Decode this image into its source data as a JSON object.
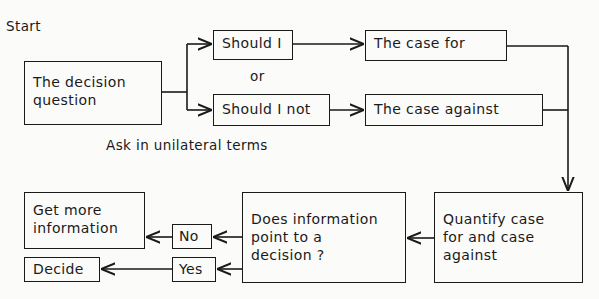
{
  "diagram": {
    "start_label": "Start",
    "or_label": "or",
    "note": "Ask in unilateral terms",
    "nodes": {
      "question": [
        "The decision",
        "question"
      ],
      "should": "Should I",
      "should_not": "Should I not",
      "case_for": "The case for",
      "case_against": "The case against",
      "quantify": [
        "Quantify case",
        "for and case",
        "against"
      ],
      "does_info": [
        "Does information",
        "point to a",
        "decision ?"
      ],
      "no": "No",
      "yes": "Yes",
      "more_info": [
        "Get more",
        "information"
      ],
      "decide": "Decide"
    },
    "edges": [
      [
        "question",
        "should"
      ],
      [
        "question",
        "should_not"
      ],
      [
        "should",
        "case_for"
      ],
      [
        "should_not",
        "case_against"
      ],
      [
        "case_for",
        "quantify"
      ],
      [
        "case_against",
        "quantify"
      ],
      [
        "quantify",
        "does_info"
      ],
      [
        "does_info",
        "no"
      ],
      [
        "does_info",
        "yes"
      ],
      [
        "no",
        "more_info"
      ],
      [
        "yes",
        "decide"
      ]
    ]
  }
}
